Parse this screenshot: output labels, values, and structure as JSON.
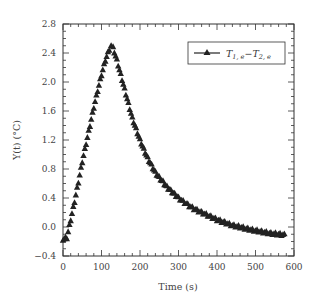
{
  "chart_data": {
    "type": "scatter",
    "title": "",
    "xlabel": "Time (s)",
    "ylabel": "Y(t) (°C)",
    "xlim": [
      0,
      600
    ],
    "ylim": [
      -0.4,
      2.8
    ],
    "xticks": [
      0,
      100,
      200,
      300,
      400,
      500,
      600
    ],
    "yticks": [
      -0.4,
      0.0,
      0.4,
      0.8,
      1.2,
      1.6,
      2.0,
      2.4,
      2.8
    ],
    "xtick_labels": [
      "0",
      "100",
      "200",
      "300",
      "400",
      "500",
      "600"
    ],
    "ytick_labels": [
      "−0.4",
      "0.0",
      "0.4",
      "0.8",
      "1.2",
      "1.6",
      "2.0",
      "2.4",
      "2.8"
    ],
    "grid": false,
    "legend_position": "upper right",
    "series": [
      {
        "name": "T1,e − T2,e",
        "marker": "triangle",
        "color": "#222222",
        "x": [
          0,
          10,
          20,
          30,
          40,
          50,
          60,
          70,
          80,
          90,
          100,
          110,
          120,
          125,
          130,
          140,
          150,
          160,
          170,
          180,
          190,
          200,
          210,
          220,
          230,
          240,
          250,
          260,
          270,
          280,
          290,
          300,
          320,
          340,
          360,
          380,
          400,
          420,
          440,
          460,
          480,
          500,
          520,
          540,
          560,
          575
        ],
        "y": [
          -0.17,
          -0.15,
          0.1,
          0.35,
          0.62,
          0.9,
          1.15,
          1.4,
          1.65,
          1.88,
          2.1,
          2.3,
          2.45,
          2.5,
          2.47,
          2.3,
          2.1,
          1.9,
          1.7,
          1.5,
          1.35,
          1.2,
          1.07,
          0.95,
          0.85,
          0.75,
          0.68,
          0.62,
          0.55,
          0.5,
          0.45,
          0.4,
          0.32,
          0.25,
          0.2,
          0.15,
          0.1,
          0.06,
          0.02,
          0.0,
          -0.03,
          -0.05,
          -0.07,
          -0.09,
          -0.1,
          -0.11
        ]
      }
    ]
  },
  "legend": {
    "label_main": "T",
    "label_sub1": "1, e",
    "label_minus": "−",
    "label_sub2": "2, e"
  }
}
